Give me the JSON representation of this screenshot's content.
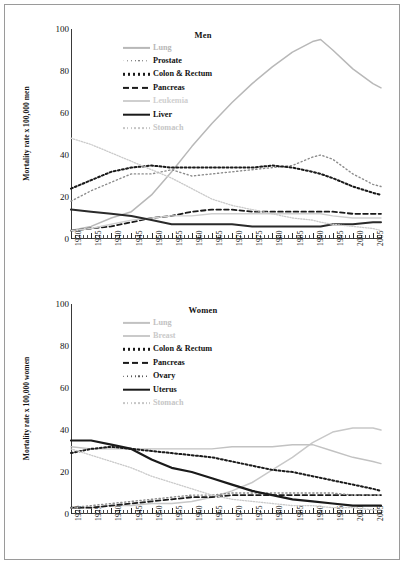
{
  "figure": {
    "background": "#ffffff",
    "border_color": "#9a9a9a"
  },
  "panels": [
    {
      "id": "men",
      "title": "Men",
      "ylabel": "Mortality rate x 100,000 men"
    },
    {
      "id": "women",
      "title": "Women",
      "ylabel": "Mortality rate x 100,000 women"
    }
  ],
  "axis": {
    "y_ticks": [
      "0",
      "20",
      "40",
      "60",
      "80",
      "100"
    ],
    "x_ticks": [
      "1930",
      "1935",
      "1940",
      "1945",
      "1950",
      "1955",
      "1960",
      "1965",
      "1970",
      "1975",
      "1980",
      "1985",
      "1990",
      "1995",
      "2000",
      "2005"
    ]
  },
  "chart_data": [
    {
      "type": "line",
      "title": "Men",
      "xlabel": "",
      "ylabel": "Mortality rate x 100,000 men",
      "xlim": [
        1930,
        2007
      ],
      "ylim": [
        0,
        100
      ],
      "grid": false,
      "legend_position": "upper-left-inside",
      "x": [
        1930,
        1935,
        1940,
        1945,
        1950,
        1955,
        1960,
        1965,
        1970,
        1975,
        1980,
        1985,
        1990,
        1992,
        1995,
        2000,
        2005,
        2007
      ],
      "series": [
        {
          "name": "Lung",
          "color": "#b8b8b8",
          "style": "solid",
          "width": 1.5,
          "values": [
            4,
            6,
            10,
            13,
            21,
            32,
            44,
            55,
            65,
            74,
            82,
            89,
            94,
            95,
            90,
            81,
            74,
            72
          ]
        },
        {
          "name": "Prostate",
          "color": "#8c8c8c",
          "style": "circles",
          "width": 1.4,
          "values": [
            18,
            23,
            27,
            31,
            31,
            33,
            30,
            31,
            32,
            33,
            34,
            35,
            39,
            40,
            38,
            31,
            26,
            25
          ]
        },
        {
          "name": "Colon & Rectum",
          "color": "#1a1a1a",
          "style": "dotted",
          "width": 2.0,
          "values": [
            24,
            28,
            32,
            34,
            35,
            34,
            34,
            34,
            34,
            34,
            35,
            34,
            32,
            31,
            29,
            25,
            22,
            21
          ]
        },
        {
          "name": "Pancreas",
          "color": "#1a1a1a",
          "style": "dashed",
          "width": 1.8,
          "values": [
            4,
            5,
            6,
            8,
            10,
            11,
            13,
            14,
            14,
            13,
            13,
            13,
            13,
            13,
            13,
            12,
            12,
            12
          ]
        },
        {
          "name": "Leukemia",
          "color": "#cfcfcf",
          "style": "solid",
          "width": 1.4,
          "values": [
            4,
            5,
            7,
            9,
            10,
            11,
            11,
            12,
            12,
            12,
            12,
            12,
            12,
            12,
            11,
            10,
            10,
            10
          ]
        },
        {
          "name": "Liver",
          "color": "#2a2a2a",
          "style": "solid",
          "width": 2.0,
          "values": [
            14,
            13,
            12,
            11,
            9,
            7,
            7,
            7,
            7,
            6,
            6,
            6,
            6,
            6,
            7,
            7,
            8,
            8
          ]
        },
        {
          "name": "Stomach",
          "color": "#cacaca",
          "style": "dotted",
          "width": 1.3,
          "values": [
            48,
            45,
            41,
            37,
            33,
            29,
            24,
            19,
            16,
            14,
            12,
            10,
            9,
            8,
            7,
            6,
            5,
            4
          ]
        }
      ]
    },
    {
      "type": "line",
      "title": "Women",
      "xlabel": "",
      "ylabel": "Mortality rate x 100,000 women",
      "xlim": [
        1930,
        2007
      ],
      "ylim": [
        0,
        100
      ],
      "grid": false,
      "legend_position": "upper-left-inside",
      "x": [
        1930,
        1935,
        1940,
        1945,
        1950,
        1955,
        1960,
        1965,
        1970,
        1975,
        1980,
        1985,
        1990,
        1995,
        2000,
        2005,
        2007
      ],
      "series": [
        {
          "name": "Lung",
          "color": "#c8c8c8",
          "style": "solid",
          "width": 1.5,
          "values": [
            3,
            3,
            4,
            4,
            5,
            5,
            6,
            8,
            11,
            15,
            21,
            27,
            34,
            39,
            41,
            41,
            40
          ]
        },
        {
          "name": "Breast",
          "color": "#c2c2c2",
          "style": "solid",
          "width": 1.4,
          "values": [
            32,
            31,
            31,
            31,
            31,
            31,
            31,
            31,
            32,
            32,
            32,
            33,
            33,
            30,
            27,
            25,
            24
          ]
        },
        {
          "name": "Colon & Rectum",
          "color": "#1a1a1a",
          "style": "dotted",
          "width": 2.0,
          "values": [
            29,
            31,
            32,
            31,
            30,
            29,
            28,
            27,
            25,
            23,
            21,
            20,
            18,
            16,
            14,
            12,
            11
          ]
        },
        {
          "name": "Pancreas",
          "color": "#1a1a1a",
          "style": "dashed",
          "width": 1.8,
          "values": [
            3,
            3,
            4,
            5,
            6,
            7,
            8,
            8,
            9,
            9,
            9,
            9,
            9,
            9,
            9,
            9,
            9
          ]
        },
        {
          "name": "Ovary",
          "color": "#8c8c8c",
          "style": "circles",
          "width": 1.4,
          "values": [
            3,
            4,
            5,
            6,
            7,
            8,
            9,
            9,
            10,
            10,
            10,
            10,
            10,
            10,
            9,
            9,
            9
          ]
        },
        {
          "name": "Uterus",
          "color": "#1a1a1a",
          "style": "solid",
          "width": 2.2,
          "values": [
            35,
            35,
            33,
            31,
            26,
            22,
            20,
            17,
            14,
            11,
            9,
            7,
            6,
            5,
            4,
            4,
            4
          ]
        },
        {
          "name": "Stomach",
          "color": "#cacaca",
          "style": "dotted",
          "width": 1.3,
          "values": [
            31,
            28,
            25,
            22,
            18,
            15,
            12,
            9,
            7,
            6,
            5,
            4,
            4,
            3,
            3,
            2,
            2
          ]
        }
      ]
    }
  ],
  "legends": {
    "men": [
      {
        "label": "Lung",
        "swatch": "solid",
        "color": "#b8b8b8",
        "width": 2.2,
        "faded": true
      },
      {
        "label": "Prostate",
        "swatch": "circles",
        "color": "#5a5a5a",
        "width": 1.4,
        "faded": false
      },
      {
        "label": "Colon & Rectum",
        "swatch": "dotted",
        "color": "#1a1a1a",
        "width": 2.4,
        "faded": false
      },
      {
        "label": "Pancreas",
        "swatch": "dashed",
        "color": "#1a1a1a",
        "width": 2.2,
        "faded": false
      },
      {
        "label": "Leukemia",
        "swatch": "solid",
        "color": "#cfcfcf",
        "width": 2.0,
        "faded": true
      },
      {
        "label": "Liver",
        "swatch": "solid",
        "color": "#1a1a1a",
        "width": 2.6,
        "faded": false
      },
      {
        "label": "Stomach",
        "swatch": "dotted",
        "color": "#c6c6c6",
        "width": 1.8,
        "faded": true
      }
    ],
    "women": [
      {
        "label": "Lung",
        "swatch": "solid",
        "color": "#c2c2c2",
        "width": 2.2,
        "faded": true
      },
      {
        "label": "Breast",
        "swatch": "solid",
        "color": "#cacaca",
        "width": 2.0,
        "faded": true
      },
      {
        "label": "Colon & Rectum",
        "swatch": "dotted",
        "color": "#1a1a1a",
        "width": 2.4,
        "faded": false
      },
      {
        "label": "Pancreas",
        "swatch": "dashed",
        "color": "#1a1a1a",
        "width": 2.2,
        "faded": false
      },
      {
        "label": "Ovary",
        "swatch": "circles",
        "color": "#5a5a5a",
        "width": 1.4,
        "faded": false
      },
      {
        "label": "Uterus",
        "swatch": "solid",
        "color": "#1a1a1a",
        "width": 2.6,
        "faded": false
      },
      {
        "label": "Stomach",
        "swatch": "dotted",
        "color": "#c6c6c6",
        "width": 1.8,
        "faded": true
      }
    ]
  }
}
